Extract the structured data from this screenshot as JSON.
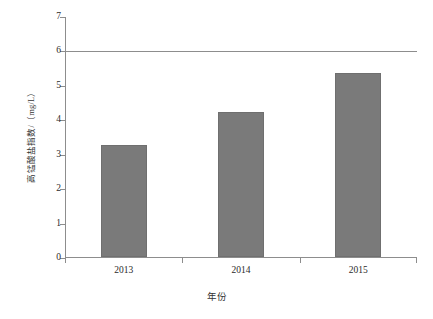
{
  "chart_data": {
    "type": "bar",
    "title": "",
    "categories": [
      "2013",
      "2014",
      "2015"
    ],
    "values": [
      3.25,
      4.2,
      5.35
    ],
    "series": [
      {
        "name": "高锰酸盐指数",
        "values": [
          3.25,
          4.2,
          5.35
        ]
      }
    ],
    "xlabel": "年份",
    "ylabel": "高锰酸盐指数/（mg/L）",
    "ylim": [
      0,
      7
    ],
    "ytick_labels": [
      "0",
      "1",
      "2",
      "3",
      "4",
      "5",
      "6",
      "7"
    ],
    "ytick_values": [
      0,
      1,
      2,
      3,
      4,
      5,
      6,
      7
    ],
    "grid": false,
    "legend": "none",
    "annotations": [
      {
        "name": "reference-line",
        "type": "hline",
        "value": 6,
        "label": ""
      }
    ],
    "bar_color": "#7a7a7a",
    "axis_color": "#8d8d8d",
    "background_color": "#ffffff"
  }
}
